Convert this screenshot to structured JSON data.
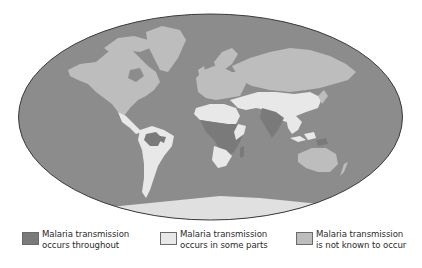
{
  "map": {
    "projection": "elliptical world map",
    "colors": {
      "ocean": "#8c8c8c",
      "throughout": "#7a7a7a",
      "some_parts": "#e8e8e8",
      "not_known": "#bdbdbd",
      "outline": "#3a3a3a"
    }
  },
  "legend": {
    "items": [
      {
        "line1": "Malaria transmission",
        "line2": "occurs throughout",
        "color": "#7a7a7a"
      },
      {
        "line1": "Malaria transmission",
        "line2": "occurs in some parts",
        "color": "#e8e8e8"
      },
      {
        "line1": "Malaria transmission",
        "line2": "is not known to occur",
        "color": "#bdbdbd"
      }
    ]
  }
}
